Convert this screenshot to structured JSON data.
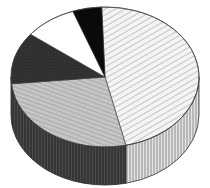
{
  "chart_data": {
    "type": "pie",
    "style": "3d-sketch",
    "title": "",
    "labels": [
      "",
      "",
      "",
      "",
      ""
    ],
    "slices": [
      {
        "name": "hatched",
        "value": 47,
        "fill": "#f2f2f2",
        "pattern": "diagonal-hatch"
      },
      {
        "name": "light-gray",
        "value": 27,
        "fill": "#bdbdbd",
        "pattern": "stipple"
      },
      {
        "name": "dark",
        "value": 12,
        "fill": "#2e2e2e",
        "pattern": "stipple"
      },
      {
        "name": "white",
        "value": 9,
        "fill": "#ffffff",
        "pattern": "none"
      },
      {
        "name": "black",
        "value": 5,
        "fill": "#0a0a0a",
        "pattern": "none"
      }
    ],
    "start_angle_deg": -92,
    "direction": "clockwise",
    "legend": "none"
  },
  "colors": {
    "background": "#ffffff",
    "outline": "#222222",
    "rim_dark": "#3a3a3a",
    "rim_light": "#d9d9d9"
  },
  "geometry": {
    "cx": 105,
    "cy": 77,
    "rx": 94,
    "ry": 70,
    "depth": 38
  }
}
